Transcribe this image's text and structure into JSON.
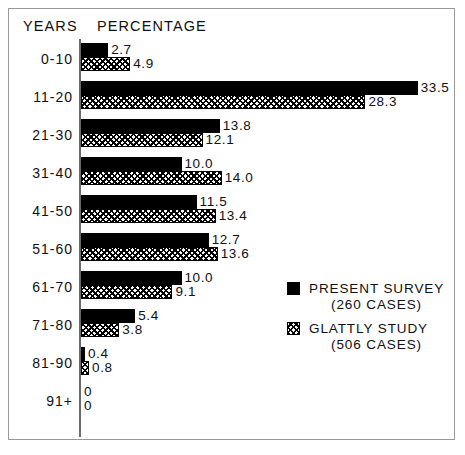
{
  "header": {
    "years_label": "YEARS",
    "percentage_label": "PERCENTAGE"
  },
  "legend": {
    "present": {
      "label": "PRESENT SURVEY",
      "sub": "(260 CASES)",
      "swatch": "solid-black-square-icon"
    },
    "glattly": {
      "label": "GLATTLY STUDY",
      "sub": "(506 CASES)",
      "swatch": "crosshatch-square-icon"
    }
  },
  "chart_data": {
    "type": "bar",
    "orientation": "horizontal",
    "title": "",
    "xlabel": "PERCENTAGE",
    "ylabel": "YEARS",
    "xlim": [
      0,
      35
    ],
    "grid": false,
    "legend_position": "middle-right",
    "categories": [
      "0-10",
      "11-20",
      "21-30",
      "31-40",
      "41-50",
      "51-60",
      "61-70",
      "71-80",
      "81-90",
      "91+"
    ],
    "series": [
      {
        "name": "PRESENT SURVEY",
        "cases": 260,
        "fill": "solid-black",
        "values": [
          2.7,
          33.5,
          13.8,
          10.0,
          11.5,
          12.7,
          10.0,
          5.4,
          0.4,
          0
        ],
        "labels": [
          "2.7",
          "33.5",
          "13.8",
          "10.0",
          "11.5",
          "12.7",
          "10.0",
          "5.4",
          "0.4",
          "0"
        ]
      },
      {
        "name": "GLATTLY STUDY",
        "cases": 506,
        "fill": "crosshatch",
        "values": [
          4.9,
          28.3,
          12.1,
          14.0,
          13.4,
          13.6,
          9.1,
          3.8,
          0.8,
          0
        ],
        "labels": [
          "4.9",
          "28.3",
          "12.1",
          "14.0",
          "13.4",
          "13.6",
          "9.1",
          "3.8",
          "0.8",
          "0"
        ]
      }
    ]
  },
  "colors": {
    "series_present": "#000000",
    "series_glattly_line": "#000000",
    "background": "#ffffff",
    "frame": "#999999",
    "axis": "#6a6a6a"
  }
}
